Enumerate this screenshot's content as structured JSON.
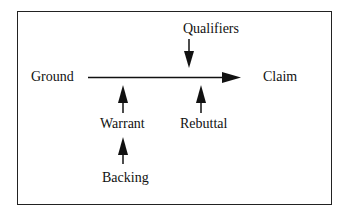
{
  "diagram": {
    "nodes": {
      "ground": "Ground",
      "claim": "Claim",
      "qualifiers": "Qualifiers",
      "warrant": "Warrant",
      "rebuttal": "Rebuttal",
      "backing": "Backing"
    },
    "edges": [
      {
        "from": "Ground",
        "to": "Claim",
        "type": "main-arrow"
      },
      {
        "from": "Qualifiers",
        "to": "Ground-Claim arrow",
        "direction": "down"
      },
      {
        "from": "Warrant",
        "to": "Ground-Claim arrow",
        "direction": "up"
      },
      {
        "from": "Rebuttal",
        "to": "Ground-Claim arrow",
        "direction": "up"
      },
      {
        "from": "Backing",
        "to": "Warrant",
        "direction": "up"
      }
    ],
    "colors": {
      "stroke": "#111111",
      "background": "#ffffff"
    }
  }
}
